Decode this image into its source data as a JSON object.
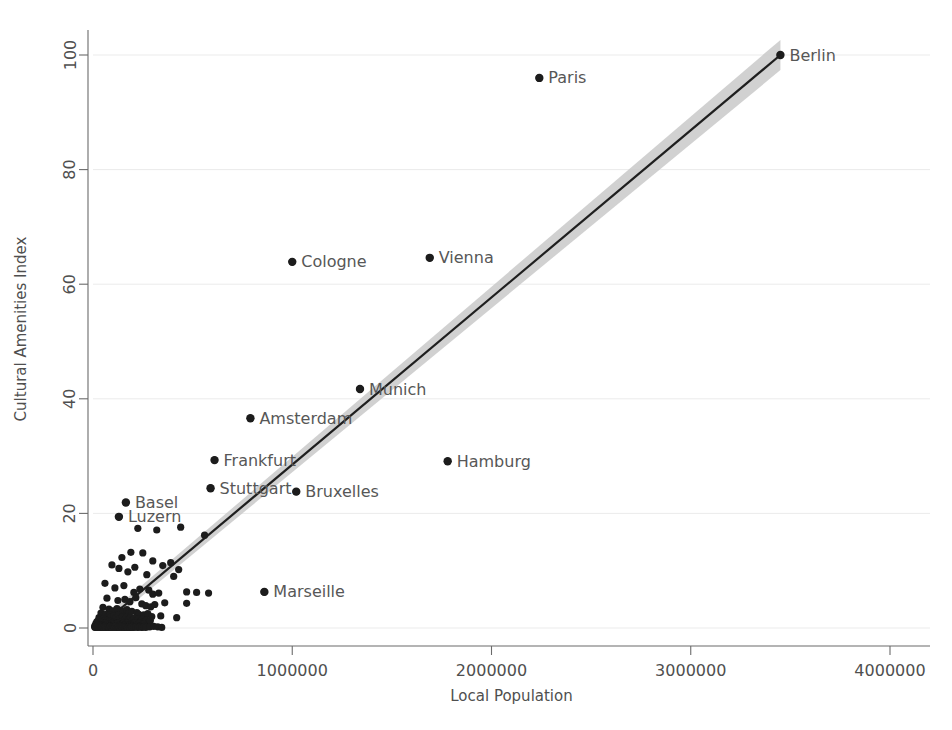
{
  "chart_data": {
    "type": "scatter",
    "title": "",
    "xlabel": "Local Population",
    "ylabel": "Cultural Amenities Index",
    "xlim": [
      0,
      4200000
    ],
    "ylim": [
      -2,
      104
    ],
    "grid": true,
    "legend": "none",
    "xticks": [
      0,
      1000000,
      2000000,
      3000000,
      4000000
    ],
    "xtick_labels": [
      "0",
      "1000000",
      "2000000",
      "3000000",
      "4000000"
    ],
    "yticks": [
      0,
      20,
      40,
      60,
      80,
      100
    ],
    "ytick_labels": [
      "0",
      "20",
      "40",
      "60",
      "80",
      "100"
    ],
    "annotations": [
      {
        "label": "Berlin",
        "x": 3450000,
        "y": 100.0
      },
      {
        "label": "Paris",
        "x": 2240000,
        "y": 96.0
      },
      {
        "label": "Vienna",
        "x": 1690000,
        "y": 64.6
      },
      {
        "label": "Cologne",
        "x": 1000000,
        "y": 63.9
      },
      {
        "label": "Munich",
        "x": 1340000,
        "y": 41.7
      },
      {
        "label": "Amsterdam",
        "x": 790000,
        "y": 36.6
      },
      {
        "label": "Hamburg",
        "x": 1780000,
        "y": 29.1
      },
      {
        "label": "Frankfurt",
        "x": 610000,
        "y": 29.3
      },
      {
        "label": "Stuttgart",
        "x": 590000,
        "y": 24.4
      },
      {
        "label": "Bruxelles",
        "x": 1020000,
        "y": 23.8
      },
      {
        "label": "Basel",
        "x": 165000,
        "y": 21.9
      },
      {
        "label": "Luzern",
        "x": 130000,
        "y": 19.4
      },
      {
        "label": "Marseille",
        "x": 860000,
        "y": 6.3
      }
    ],
    "fit": {
      "description": "linear fit with shaded confidence band",
      "x0": 40000,
      "y0": 0.5,
      "x1": 3450000,
      "y1": 100.0,
      "band_half_width_at_x0": 0.4,
      "band_half_width_at_x1": 2.2,
      "line_color": "#1f1f1f",
      "band_color": "#c9c9c9"
    },
    "points": [
      [
        3450000,
        100.0
      ],
      [
        2240000,
        96.0
      ],
      [
        1690000,
        64.6
      ],
      [
        1000000,
        63.9
      ],
      [
        1340000,
        41.7
      ],
      [
        790000,
        36.6
      ],
      [
        1780000,
        29.1
      ],
      [
        610000,
        29.3
      ],
      [
        590000,
        24.4
      ],
      [
        1020000,
        23.8
      ],
      [
        165000,
        21.9
      ],
      [
        130000,
        19.4
      ],
      [
        860000,
        6.3
      ],
      [
        440000,
        17.6
      ],
      [
        225000,
        17.4
      ],
      [
        320000,
        17.1
      ],
      [
        560000,
        16.2
      ],
      [
        190000,
        13.2
      ],
      [
        250000,
        13.1
      ],
      [
        145000,
        12.3
      ],
      [
        300000,
        11.7
      ],
      [
        95000,
        11.0
      ],
      [
        130000,
        10.4
      ],
      [
        210000,
        10.6
      ],
      [
        175000,
        9.8
      ],
      [
        270000,
        9.3
      ],
      [
        350000,
        10.9
      ],
      [
        390000,
        11.4
      ],
      [
        430000,
        10.2
      ],
      [
        405000,
        9.0
      ],
      [
        470000,
        6.3
      ],
      [
        520000,
        6.2
      ],
      [
        580000,
        6.1
      ],
      [
        60000,
        7.8
      ],
      [
        110000,
        7.0
      ],
      [
        155000,
        7.4
      ],
      [
        235000,
        6.8
      ],
      [
        205000,
        6.2
      ],
      [
        280000,
        6.6
      ],
      [
        300000,
        5.9
      ],
      [
        330000,
        6.1
      ],
      [
        360000,
        4.4
      ],
      [
        470000,
        4.3
      ],
      [
        70000,
        5.2
      ],
      [
        125000,
        4.8
      ],
      [
        160000,
        5.0
      ],
      [
        185000,
        4.6
      ],
      [
        215000,
        5.3
      ],
      [
        245000,
        4.2
      ],
      [
        265000,
        3.9
      ],
      [
        290000,
        3.7
      ],
      [
        310000,
        4.1
      ],
      [
        340000,
        2.1
      ],
      [
        420000,
        1.8
      ],
      [
        50000,
        3.6
      ],
      [
        80000,
        3.3
      ],
      [
        100000,
        3.0
      ],
      [
        120000,
        3.4
      ],
      [
        140000,
        3.1
      ],
      [
        150000,
        2.8
      ],
      [
        170000,
        3.2
      ],
      [
        180000,
        2.6
      ],
      [
        195000,
        2.9
      ],
      [
        220000,
        2.7
      ],
      [
        230000,
        2.4
      ],
      [
        255000,
        2.3
      ],
      [
        275000,
        2.5
      ],
      [
        295000,
        2.0
      ],
      [
        40000,
        2.6
      ],
      [
        55000,
        2.2
      ],
      [
        65000,
        2.4
      ],
      [
        75000,
        2.0
      ],
      [
        85000,
        2.3
      ],
      [
        90000,
        1.9
      ],
      [
        105000,
        2.1
      ],
      [
        115000,
        1.8
      ],
      [
        128000,
        2.2
      ],
      [
        135000,
        1.7
      ],
      [
        148000,
        2.0
      ],
      [
        158000,
        1.6
      ],
      [
        168000,
        1.9
      ],
      [
        178000,
        1.5
      ],
      [
        188000,
        1.8
      ],
      [
        198000,
        1.4
      ],
      [
        208000,
        1.7
      ],
      [
        218000,
        1.3
      ],
      [
        228000,
        1.6
      ],
      [
        238000,
        1.2
      ],
      [
        248000,
        1.5
      ],
      [
        258000,
        1.1
      ],
      [
        268000,
        1.4
      ],
      [
        278000,
        1.0
      ],
      [
        288000,
        1.3
      ],
      [
        30000,
        1.8
      ],
      [
        35000,
        1.5
      ],
      [
        45000,
        1.3
      ],
      [
        52000,
        1.6
      ],
      [
        58000,
        1.2
      ],
      [
        62000,
        1.4
      ],
      [
        68000,
        1.0
      ],
      [
        72000,
        1.3
      ],
      [
        78000,
        0.9
      ],
      [
        82000,
        1.2
      ],
      [
        88000,
        0.8
      ],
      [
        92000,
        1.1
      ],
      [
        98000,
        0.7
      ],
      [
        102000,
        1.0
      ],
      [
        108000,
        0.6
      ],
      [
        112000,
        0.9
      ],
      [
        118000,
        0.5
      ],
      [
        122000,
        0.8
      ],
      [
        132000,
        0.7
      ],
      [
        138000,
        1.0
      ],
      [
        142000,
        0.6
      ],
      [
        152000,
        0.9
      ],
      [
        162000,
        0.5
      ],
      [
        172000,
        0.8
      ],
      [
        182000,
        0.4
      ],
      [
        192000,
        0.7
      ],
      [
        202000,
        0.6
      ],
      [
        212000,
        0.9
      ],
      [
        222000,
        0.5
      ],
      [
        232000,
        0.8
      ],
      [
        242000,
        0.4
      ],
      [
        252000,
        0.7
      ],
      [
        20000,
        1.1
      ],
      [
        25000,
        0.9
      ],
      [
        28000,
        1.4
      ],
      [
        33000,
        0.7
      ],
      [
        38000,
        1.0
      ],
      [
        42000,
        0.6
      ],
      [
        48000,
        0.9
      ],
      [
        54000,
        0.5
      ],
      [
        60000,
        0.8
      ],
      [
        66000,
        0.4
      ],
      [
        71000,
        0.7
      ],
      [
        76000,
        0.3
      ],
      [
        84000,
        0.6
      ],
      [
        89000,
        0.5
      ],
      [
        94000,
        0.8
      ],
      [
        99000,
        0.4
      ],
      [
        104000,
        0.7
      ],
      [
        109000,
        0.3
      ],
      [
        114000,
        0.6
      ],
      [
        119000,
        0.5
      ],
      [
        124000,
        0.8
      ],
      [
        129000,
        0.4
      ],
      [
        134000,
        0.6
      ],
      [
        139000,
        0.3
      ],
      [
        144000,
        0.5
      ],
      [
        149000,
        0.7
      ],
      [
        154000,
        0.4
      ],
      [
        159000,
        0.6
      ],
      [
        164000,
        0.3
      ],
      [
        169000,
        0.5
      ],
      [
        174000,
        0.2
      ],
      [
        179000,
        0.4
      ],
      [
        184000,
        0.6
      ],
      [
        189000,
        0.3
      ],
      [
        194000,
        0.5
      ],
      [
        199000,
        0.2
      ],
      [
        15000,
        0.8
      ],
      [
        18000,
        0.5
      ],
      [
        22000,
        0.3
      ],
      [
        26000,
        0.6
      ],
      [
        31000,
        0.4
      ],
      [
        36000,
        0.2
      ],
      [
        41000,
        0.5
      ],
      [
        46000,
        0.3
      ],
      [
        51000,
        0.6
      ],
      [
        56000,
        0.2
      ],
      [
        61000,
        0.4
      ],
      [
        67000,
        0.6
      ],
      [
        73000,
        0.2
      ],
      [
        79000,
        0.5
      ],
      [
        86000,
        0.3
      ],
      [
        96000,
        0.2
      ],
      [
        106000,
        0.4
      ],
      [
        116000,
        0.2
      ],
      [
        126000,
        0.5
      ],
      [
        136000,
        0.2
      ],
      [
        146000,
        0.3
      ],
      [
        156000,
        0.5
      ],
      [
        166000,
        0.2
      ],
      [
        176000,
        0.4
      ],
      [
        186000,
        0.2
      ],
      [
        196000,
        0.3
      ],
      [
        206000,
        0.2
      ],
      [
        216000,
        0.4
      ],
      [
        226000,
        0.2
      ],
      [
        236000,
        0.3
      ],
      [
        246000,
        0.2
      ],
      [
        256000,
        0.4
      ],
      [
        10000,
        0.4
      ],
      [
        12000,
        0.2
      ],
      [
        16000,
        0.6
      ],
      [
        19000,
        0.3
      ],
      [
        23000,
        0.1
      ],
      [
        27000,
        0.4
      ],
      [
        32000,
        0.2
      ],
      [
        37000,
        0.5
      ],
      [
        43000,
        0.1
      ],
      [
        49000,
        0.3
      ],
      [
        57000,
        0.1
      ],
      [
        63000,
        0.4
      ],
      [
        69000,
        0.2
      ],
      [
        77000,
        0.1
      ],
      [
        83000,
        0.3
      ],
      [
        91000,
        0.1
      ],
      [
        97000,
        0.2
      ],
      [
        103000,
        0.4
      ],
      [
        111000,
        0.1
      ],
      [
        117000,
        0.3
      ],
      [
        123000,
        0.1
      ],
      [
        131000,
        0.2
      ],
      [
        137000,
        0.4
      ],
      [
        143000,
        0.1
      ],
      [
        151000,
        0.3
      ],
      [
        157000,
        0.1
      ],
      [
        163000,
        0.2
      ],
      [
        171000,
        0.3
      ],
      [
        177000,
        0.1
      ],
      [
        183000,
        0.2
      ],
      [
        191000,
        0.1
      ],
      [
        197000,
        0.3
      ],
      [
        8000,
        0.2
      ],
      [
        11000,
        0.1
      ],
      [
        14000,
        0.3
      ],
      [
        17000,
        0.1
      ],
      [
        21000,
        0.2
      ],
      [
        24000,
        0.4
      ],
      [
        29000,
        0.1
      ],
      [
        34000,
        0.3
      ],
      [
        39000,
        0.1
      ],
      [
        44000,
        0.2
      ],
      [
        53000,
        0.1
      ],
      [
        59000,
        0.3
      ],
      [
        64000,
        0.1
      ],
      [
        74000,
        0.2
      ],
      [
        81000,
        0.1
      ],
      [
        87000,
        0.3
      ],
      [
        93000,
        0.1
      ],
      [
        101000,
        0.2
      ],
      [
        107000,
        0.1
      ],
      [
        113000,
        0.3
      ],
      [
        121000,
        0.1
      ],
      [
        127000,
        0.2
      ],
      [
        133000,
        0.1
      ],
      [
        141000,
        0.3
      ],
      [
        147000,
        0.1
      ],
      [
        153000,
        0.2
      ],
      [
        161000,
        0.1
      ],
      [
        167000,
        0.2
      ],
      [
        173000,
        0.1
      ],
      [
        181000,
        0.2
      ],
      [
        187000,
        0.1
      ],
      [
        193000,
        0.2
      ],
      [
        205000,
        0.1
      ],
      [
        215000,
        0.2
      ],
      [
        225000,
        0.1
      ],
      [
        235000,
        0.2
      ],
      [
        245000,
        0.1
      ],
      [
        255000,
        0.2
      ],
      [
        265000,
        0.1
      ],
      [
        285000,
        0.2
      ],
      [
        305000,
        0.3
      ],
      [
        325000,
        0.2
      ],
      [
        345000,
        0.1
      ]
    ]
  }
}
